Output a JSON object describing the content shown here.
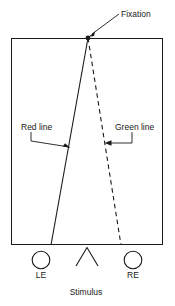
{
  "figure": {
    "type": "optics-stereopsis-schematic",
    "background_color": "#ffffff",
    "ink_color": "#1a1a1a"
  },
  "labels": {
    "fixation": "Fixation",
    "red_line": "Red line",
    "green_line": "Green line",
    "left_eye": "LE",
    "right_eye": "RE",
    "stimulus": "Stimulus"
  },
  "geometry": {
    "frame": {
      "x": 11,
      "y": 38,
      "width": 152,
      "height": 207
    },
    "fixation_point": {
      "x": 88,
      "y": 38
    },
    "red_line": {
      "x1": 88,
      "y1": 38,
      "x2": 51,
      "y2": 245,
      "style": "solid"
    },
    "green_line": {
      "x1": 88,
      "y1": 38,
      "x2": 121,
      "y2": 245,
      "style": "dashed"
    },
    "left_eye_circle": {
      "cx": 41,
      "cy": 260,
      "r": 9
    },
    "right_eye_circle": {
      "cx": 133,
      "cy": 260,
      "r": 9
    },
    "stimulus_caret": {
      "apex_x": 87,
      "apex_y": 247,
      "left_x": 76,
      "right_x": 98,
      "base_y": 266
    }
  },
  "leaders": {
    "fixation_arrow": {
      "from_x": 119,
      "from_y": 14,
      "to_x": 90,
      "to_y": 36
    },
    "red_arrow": {
      "start_x": 31,
      "start_y": 132,
      "elbow_x": 31,
      "elbow_y": 141,
      "to_x": 69,
      "to_y": 148
    },
    "green_arrow": {
      "start_x": 132,
      "start_y": 132,
      "elbow_x": 132,
      "elbow_y": 143,
      "to_x": 106,
      "to_y": 143
    }
  }
}
